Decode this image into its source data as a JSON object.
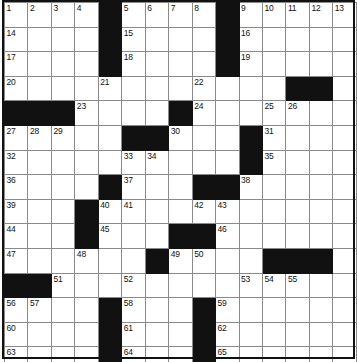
{
  "puzzle": {
    "title": "Crossword Puzzle Grid",
    "columns": 13,
    "rows": 15,
    "colors": {
      "block": "#111111",
      "cell": "#ffffff",
      "grid_line": "#8a8a8a",
      "number_text": "#111111",
      "frame": "#111111"
    },
    "grid": [
      [
        {
          "type": "cell",
          "number": "1"
        },
        {
          "type": "cell",
          "number": "2"
        },
        {
          "type": "cell",
          "number": "3"
        },
        {
          "type": "cell",
          "number": "4"
        },
        {
          "type": "block",
          "number": ""
        },
        {
          "type": "cell",
          "number": "5"
        },
        {
          "type": "cell",
          "number": "6"
        },
        {
          "type": "cell",
          "number": "7"
        },
        {
          "type": "cell",
          "number": "8"
        },
        {
          "type": "block",
          "number": ""
        },
        {
          "type": "cell",
          "number": "9"
        },
        {
          "type": "cell",
          "number": "10"
        },
        {
          "type": "cell",
          "number": "11"
        },
        {
          "type": "cell",
          "number": "12"
        },
        {
          "type": "cell",
          "number": "13"
        }
      ],
      [
        {
          "type": "cell",
          "number": "14"
        },
        {
          "type": "cell",
          "number": ""
        },
        {
          "type": "cell",
          "number": ""
        },
        {
          "type": "cell",
          "number": ""
        },
        {
          "type": "block",
          "number": ""
        },
        {
          "type": "cell",
          "number": "15"
        },
        {
          "type": "cell",
          "number": ""
        },
        {
          "type": "cell",
          "number": ""
        },
        {
          "type": "cell",
          "number": ""
        },
        {
          "type": "block",
          "number": ""
        },
        {
          "type": "cell",
          "number": "16"
        },
        {
          "type": "cell",
          "number": ""
        },
        {
          "type": "cell",
          "number": ""
        },
        {
          "type": "cell",
          "number": ""
        },
        {
          "type": "cell",
          "number": ""
        }
      ],
      [
        {
          "type": "cell",
          "number": "17"
        },
        {
          "type": "cell",
          "number": ""
        },
        {
          "type": "cell",
          "number": ""
        },
        {
          "type": "cell",
          "number": ""
        },
        {
          "type": "block",
          "number": ""
        },
        {
          "type": "cell",
          "number": "18"
        },
        {
          "type": "cell",
          "number": ""
        },
        {
          "type": "cell",
          "number": ""
        },
        {
          "type": "cell",
          "number": ""
        },
        {
          "type": "block",
          "number": ""
        },
        {
          "type": "cell",
          "number": "19"
        },
        {
          "type": "cell",
          "number": ""
        },
        {
          "type": "cell",
          "number": ""
        },
        {
          "type": "cell",
          "number": ""
        },
        {
          "type": "cell",
          "number": ""
        }
      ],
      [
        {
          "type": "cell",
          "number": "20"
        },
        {
          "type": "cell",
          "number": ""
        },
        {
          "type": "cell",
          "number": ""
        },
        {
          "type": "cell",
          "number": ""
        },
        {
          "type": "cell",
          "number": "21"
        },
        {
          "type": "cell",
          "number": ""
        },
        {
          "type": "cell",
          "number": ""
        },
        {
          "type": "cell",
          "number": ""
        },
        {
          "type": "cell",
          "number": "22"
        },
        {
          "type": "cell",
          "number": ""
        },
        {
          "type": "cell",
          "number": ""
        },
        {
          "type": "cell",
          "number": ""
        },
        {
          "type": "block",
          "number": ""
        },
        {
          "type": "block",
          "number": ""
        },
        {
          "type": "cell",
          "number": ""
        }
      ],
      [
        {
          "type": "block",
          "number": ""
        },
        {
          "type": "block",
          "number": ""
        },
        {
          "type": "block",
          "number": ""
        },
        {
          "type": "cell",
          "number": "23"
        },
        {
          "type": "cell",
          "number": ""
        },
        {
          "type": "cell",
          "number": ""
        },
        {
          "type": "cell",
          "number": ""
        },
        {
          "type": "block",
          "number": ""
        },
        {
          "type": "cell",
          "number": "24"
        },
        {
          "type": "cell",
          "number": ""
        },
        {
          "type": "cell",
          "number": ""
        },
        {
          "type": "cell",
          "number": "25"
        },
        {
          "type": "cell",
          "number": "26"
        },
        {
          "type": "cell",
          "number": ""
        },
        {
          "type": "cell",
          "number": ""
        }
      ],
      [
        {
          "type": "cell",
          "number": "27"
        },
        {
          "type": "cell",
          "number": "28"
        },
        {
          "type": "cell",
          "number": "29"
        },
        {
          "type": "cell",
          "number": ""
        },
        {
          "type": "cell",
          "number": ""
        },
        {
          "type": "block",
          "number": ""
        },
        {
          "type": "block",
          "number": ""
        },
        {
          "type": "cell",
          "number": "30"
        },
        {
          "type": "cell",
          "number": ""
        },
        {
          "type": "cell",
          "number": ""
        },
        {
          "type": "block",
          "number": ""
        },
        {
          "type": "cell",
          "number": "31"
        },
        {
          "type": "cell",
          "number": ""
        },
        {
          "type": "cell",
          "number": ""
        },
        {
          "type": "cell",
          "number": ""
        }
      ],
      [
        {
          "type": "cell",
          "number": "32"
        },
        {
          "type": "cell",
          "number": ""
        },
        {
          "type": "cell",
          "number": ""
        },
        {
          "type": "cell",
          "number": ""
        },
        {
          "type": "cell",
          "number": ""
        },
        {
          "type": "cell",
          "number": "33"
        },
        {
          "type": "cell",
          "number": "34"
        },
        {
          "type": "cell",
          "number": ""
        },
        {
          "type": "cell",
          "number": ""
        },
        {
          "type": "cell",
          "number": ""
        },
        {
          "type": "block",
          "number": ""
        },
        {
          "type": "cell",
          "number": "35"
        },
        {
          "type": "cell",
          "number": ""
        },
        {
          "type": "cell",
          "number": ""
        },
        {
          "type": "cell",
          "number": ""
        }
      ],
      [
        {
          "type": "cell",
          "number": "36"
        },
        {
          "type": "cell",
          "number": ""
        },
        {
          "type": "cell",
          "number": ""
        },
        {
          "type": "cell",
          "number": ""
        },
        {
          "type": "block",
          "number": ""
        },
        {
          "type": "cell",
          "number": "37"
        },
        {
          "type": "cell",
          "number": ""
        },
        {
          "type": "cell",
          "number": ""
        },
        {
          "type": "block",
          "number": ""
        },
        {
          "type": "block",
          "number": ""
        },
        {
          "type": "cell",
          "number": "38"
        },
        {
          "type": "cell",
          "number": ""
        },
        {
          "type": "cell",
          "number": ""
        },
        {
          "type": "cell",
          "number": ""
        },
        {
          "type": "cell",
          "number": ""
        }
      ],
      [
        {
          "type": "cell",
          "number": "39"
        },
        {
          "type": "cell",
          "number": ""
        },
        {
          "type": "cell",
          "number": ""
        },
        {
          "type": "block",
          "number": ""
        },
        {
          "type": "cell",
          "number": "40"
        },
        {
          "type": "cell",
          "number": "41"
        },
        {
          "type": "cell",
          "number": ""
        },
        {
          "type": "cell",
          "number": ""
        },
        {
          "type": "cell",
          "number": "42"
        },
        {
          "type": "cell",
          "number": "43"
        },
        {
          "type": "cell",
          "number": ""
        },
        {
          "type": "cell",
          "number": ""
        },
        {
          "type": "cell",
          "number": ""
        },
        {
          "type": "cell",
          "number": ""
        },
        {
          "type": "cell",
          "number": ""
        }
      ],
      [
        {
          "type": "cell",
          "number": "44"
        },
        {
          "type": "cell",
          "number": ""
        },
        {
          "type": "cell",
          "number": ""
        },
        {
          "type": "block",
          "number": ""
        },
        {
          "type": "cell",
          "number": "45"
        },
        {
          "type": "cell",
          "number": ""
        },
        {
          "type": "cell",
          "number": ""
        },
        {
          "type": "block",
          "number": ""
        },
        {
          "type": "block",
          "number": ""
        },
        {
          "type": "cell",
          "number": "46"
        },
        {
          "type": "cell",
          "number": ""
        },
        {
          "type": "cell",
          "number": ""
        },
        {
          "type": "cell",
          "number": ""
        },
        {
          "type": "cell",
          "number": ""
        },
        {
          "type": "cell",
          "number": ""
        }
      ],
      [
        {
          "type": "cell",
          "number": "47"
        },
        {
          "type": "cell",
          "number": ""
        },
        {
          "type": "cell",
          "number": ""
        },
        {
          "type": "cell",
          "number": "48"
        },
        {
          "type": "cell",
          "number": ""
        },
        {
          "type": "cell",
          "number": ""
        },
        {
          "type": "block",
          "number": ""
        },
        {
          "type": "cell",
          "number": "49"
        },
        {
          "type": "cell",
          "number": "50"
        },
        {
          "type": "cell",
          "number": ""
        },
        {
          "type": "cell",
          "number": ""
        },
        {
          "type": "block",
          "number": ""
        },
        {
          "type": "block",
          "number": ""
        },
        {
          "type": "block",
          "number": ""
        },
        {
          "type": "cell",
          "number": ""
        }
      ],
      [
        {
          "type": "block",
          "number": ""
        },
        {
          "type": "block",
          "number": ""
        },
        {
          "type": "cell",
          "number": "51"
        },
        {
          "type": "cell",
          "number": ""
        },
        {
          "type": "cell",
          "number": ""
        },
        {
          "type": "cell",
          "number": "52"
        },
        {
          "type": "cell",
          "number": ""
        },
        {
          "type": "cell",
          "number": ""
        },
        {
          "type": "cell",
          "number": ""
        },
        {
          "type": "cell",
          "number": ""
        },
        {
          "type": "cell",
          "number": "53"
        },
        {
          "type": "cell",
          "number": "54"
        },
        {
          "type": "cell",
          "number": "55"
        },
        {
          "type": "cell",
          "number": ""
        },
        {
          "type": "cell",
          "number": ""
        }
      ],
      [
        {
          "type": "cell",
          "number": "56"
        },
        {
          "type": "cell",
          "number": "57"
        },
        {
          "type": "cell",
          "number": ""
        },
        {
          "type": "cell",
          "number": ""
        },
        {
          "type": "block",
          "number": ""
        },
        {
          "type": "cell",
          "number": "58"
        },
        {
          "type": "cell",
          "number": ""
        },
        {
          "type": "cell",
          "number": ""
        },
        {
          "type": "block",
          "number": ""
        },
        {
          "type": "cell",
          "number": "59"
        },
        {
          "type": "cell",
          "number": ""
        },
        {
          "type": "cell",
          "number": ""
        },
        {
          "type": "cell",
          "number": ""
        },
        {
          "type": "cell",
          "number": ""
        },
        {
          "type": "cell",
          "number": ""
        }
      ],
      [
        {
          "type": "cell",
          "number": "60"
        },
        {
          "type": "cell",
          "number": ""
        },
        {
          "type": "cell",
          "number": ""
        },
        {
          "type": "cell",
          "number": ""
        },
        {
          "type": "block",
          "number": ""
        },
        {
          "type": "cell",
          "number": "61"
        },
        {
          "type": "cell",
          "number": ""
        },
        {
          "type": "cell",
          "number": ""
        },
        {
          "type": "block",
          "number": ""
        },
        {
          "type": "cell",
          "number": "62"
        },
        {
          "type": "cell",
          "number": ""
        },
        {
          "type": "cell",
          "number": ""
        },
        {
          "type": "cell",
          "number": ""
        },
        {
          "type": "cell",
          "number": ""
        },
        {
          "type": "cell",
          "number": ""
        }
      ],
      [
        {
          "type": "cell",
          "number": "63"
        },
        {
          "type": "cell",
          "number": ""
        },
        {
          "type": "cell",
          "number": ""
        },
        {
          "type": "cell",
          "number": ""
        },
        {
          "type": "block",
          "number": ""
        },
        {
          "type": "cell",
          "number": "64"
        },
        {
          "type": "cell",
          "number": ""
        },
        {
          "type": "cell",
          "number": ""
        },
        {
          "type": "block",
          "number": ""
        },
        {
          "type": "cell",
          "number": "65"
        },
        {
          "type": "cell",
          "number": ""
        },
        {
          "type": "cell",
          "number": ""
        },
        {
          "type": "cell",
          "number": ""
        },
        {
          "type": "cell",
          "number": ""
        },
        {
          "type": "cell",
          "number": ""
        }
      ]
    ]
  }
}
